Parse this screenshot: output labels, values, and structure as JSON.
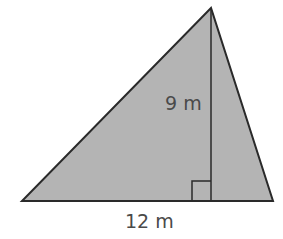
{
  "figure": {
    "shape": "triangle",
    "fill_color": "#b4b4b4",
    "stroke_color": "#2a2a2a",
    "height_label": "9 m",
    "base_label": "12 m",
    "height_value": 9,
    "base_value": 12,
    "unit": "m",
    "right_angle_marker": true
  }
}
